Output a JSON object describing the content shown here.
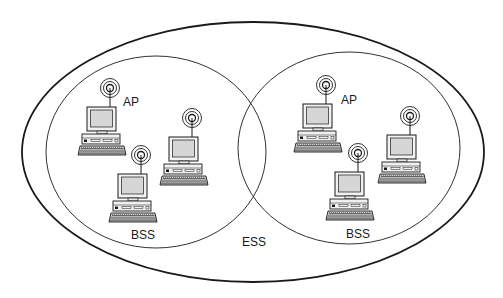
{
  "diagram": {
    "ess": {
      "label": "ESS",
      "label_pos": [
        252,
        246
      ],
      "ellipse": {
        "cx": 253,
        "cy": 152,
        "rx": 231,
        "ry": 130
      }
    },
    "bss": [
      {
        "label": "BSS",
        "label_pos": [
          141,
          239
        ],
        "ellipse": {
          "cx": 156,
          "cy": 152,
          "rx": 110,
          "ry": 96
        },
        "ap_label": "AP",
        "ap_label_pos": [
          129,
          106
        ],
        "stations": [
          {
            "role": "ap",
            "x": 110,
            "y": 88
          },
          {
            "role": "station",
            "x": 192,
            "y": 118
          },
          {
            "role": "station",
            "x": 141,
            "y": 155
          }
        ]
      },
      {
        "label": "BSS",
        "label_pos": [
          356,
          238
        ],
        "ellipse": {
          "cx": 349,
          "cy": 148,
          "rx": 111,
          "ry": 96
        },
        "ap_label": "AP",
        "ap_label_pos": [
          347,
          104
        ],
        "stations": [
          {
            "role": "ap",
            "x": 326,
            "y": 85
          },
          {
            "role": "station",
            "x": 410,
            "y": 116
          },
          {
            "role": "station",
            "x": 358,
            "y": 153
          }
        ]
      }
    ],
    "colors": {
      "line": "#1a1a1a",
      "screen": "#d9d9d9",
      "body": "#f2f2f2"
    }
  }
}
